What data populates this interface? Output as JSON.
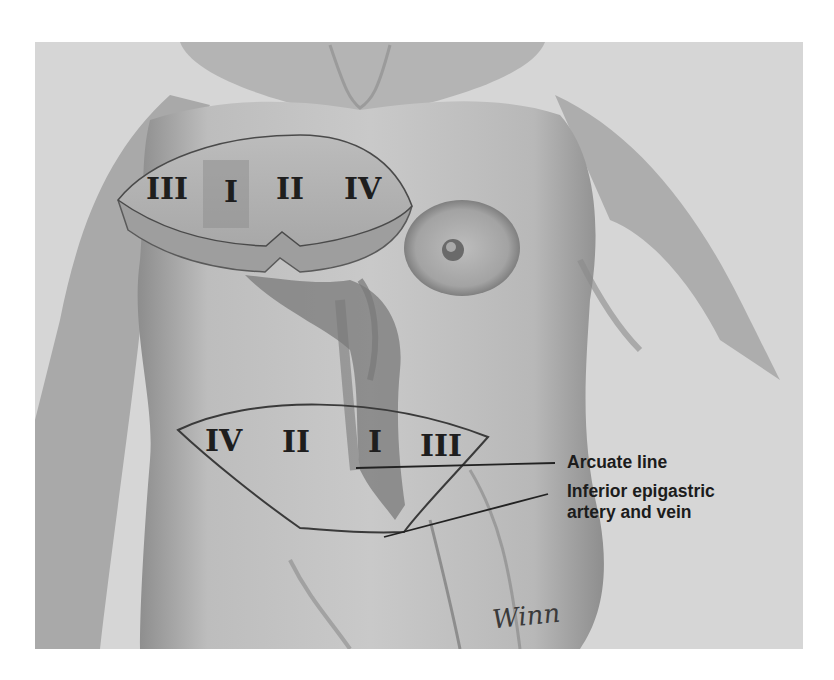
{
  "figure": {
    "upper_flap_zones": [
      "III",
      "I",
      "II",
      "IV"
    ],
    "lower_flap_zones": [
      "IV",
      "II",
      "I",
      "III"
    ],
    "labels": {
      "arcuate_line": "Arcuate line",
      "inferior_epigastric_line1": "Inferior epigastric",
      "inferior_epigastric_line2": "artery and vein"
    },
    "signature": "Winn"
  },
  "colors": {
    "background": "#d6d6d6",
    "skin_light": "#c8c8c8",
    "skin_shadow": "#8a8a8a",
    "ink": "#1e1e1e"
  }
}
